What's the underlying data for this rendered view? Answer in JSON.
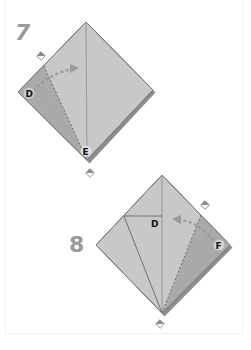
{
  "steps": [
    {
      "number": "7",
      "labels": {
        "left_corner": "D",
        "bottom_corner": "E"
      },
      "action": "fold left flap edge to center crease (valley fold with arrow)"
    },
    {
      "number": "8",
      "labels": {
        "inner_point": "D",
        "right_corner": "F"
      },
      "action": "fold right flap edge to center crease (valley fold with arrow)"
    }
  ],
  "colors": {
    "paper": "#c8c8c8",
    "paper_shaded": "#a9a9a9",
    "edge": "#7a7a7a",
    "crease": "#8a8a8a",
    "arrow": "#9a9a9a",
    "step_number": "#9a9a9a"
  },
  "icons": [
    "pivot-marker-icon",
    "fold-arrow-icon"
  ]
}
